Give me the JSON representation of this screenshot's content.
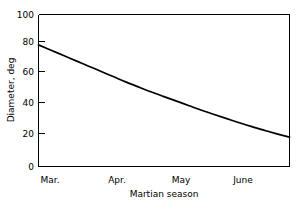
{
  "chart_data": {
    "type": "line",
    "title": "",
    "xlabel": "Martian season",
    "ylabel": "Diameter, deg",
    "ylim": [
      0,
      100
    ],
    "yticks": [
      0,
      20,
      40,
      60,
      80,
      100
    ],
    "ytick_labels": [
      "0",
      "20",
      "40",
      "60",
      "80",
      "100"
    ],
    "xtick_labels": [
      "Mar.",
      "Apr.",
      "May",
      "June"
    ],
    "grid": false,
    "legend": false,
    "line_color": "#000000",
    "background_color": "#ffffff",
    "x": [
      0,
      5,
      10,
      15,
      20,
      25,
      30,
      35,
      40,
      45,
      50,
      55,
      60,
      65,
      70,
      75,
      80,
      85,
      90,
      95,
      100
    ],
    "values": [
      80,
      76.5,
      73,
      69.5,
      66,
      62.5,
      59,
      55.5,
      52.2,
      49,
      46,
      43,
      40,
      37,
      34.2,
      31.5,
      28.8,
      26.2,
      23.8,
      21.5,
      19.3
    ],
    "series": [
      {
        "name": "Diameter",
        "x": [
          0,
          5,
          10,
          15,
          20,
          25,
          30,
          35,
          40,
          45,
          50,
          55,
          60,
          65,
          70,
          75,
          80,
          85,
          90,
          95,
          100
        ],
        "values": [
          80,
          76.5,
          73,
          69.5,
          66,
          62.5,
          59,
          55.5,
          52.2,
          49,
          46,
          43,
          40,
          37,
          34.2,
          31.5,
          28.8,
          26.2,
          23.8,
          21.5,
          19.3
        ]
      }
    ],
    "key_points": {
      "Mar.": 80,
      "Apr.": 48.5,
      "May": 29,
      "June": 13,
      "end": 5
    }
  },
  "axis": {
    "y_label": "Diameter, deg",
    "x_label": "Martian season",
    "y_tick_0": "0",
    "y_tick_20": "20",
    "y_tick_40": "40",
    "y_tick_60": "60",
    "y_tick_80": "80",
    "y_tick_100": "100",
    "x_tick_mar": "Mar.",
    "x_tick_apr": "Apr.",
    "x_tick_may": "May",
    "x_tick_june": "June"
  }
}
